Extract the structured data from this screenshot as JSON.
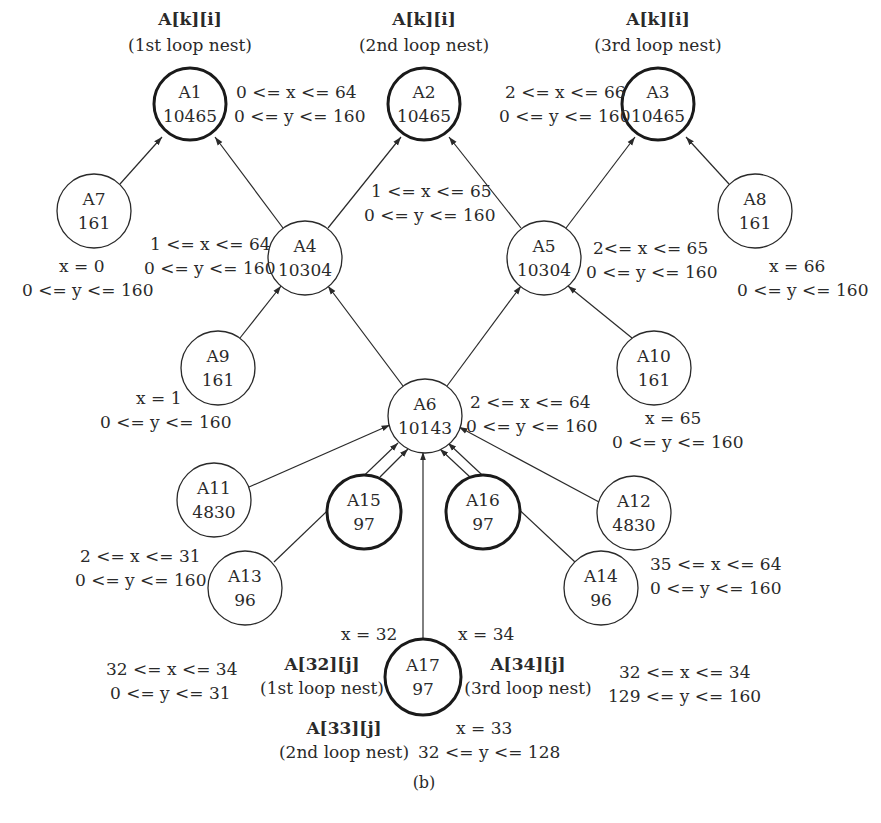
{
  "caption": "(b)",
  "nodes": {
    "A1": {
      "id": "A1",
      "value": "10465"
    },
    "A2": {
      "id": "A2",
      "value": "10465"
    },
    "A3": {
      "id": "A3",
      "value": "10465"
    },
    "A4": {
      "id": "A4",
      "value": "10304"
    },
    "A5": {
      "id": "A5",
      "value": "10304"
    },
    "A6": {
      "id": "A6",
      "value": "10143"
    },
    "A7": {
      "id": "A7",
      "value": "161"
    },
    "A8": {
      "id": "A8",
      "value": "161"
    },
    "A9": {
      "id": "A9",
      "value": "161"
    },
    "A10": {
      "id": "A10",
      "value": "161"
    },
    "A11": {
      "id": "A11",
      "value": "4830"
    },
    "A12": {
      "id": "A12",
      "value": "4830"
    },
    "A13": {
      "id": "A13",
      "value": "96"
    },
    "A14": {
      "id": "A14",
      "value": "96"
    },
    "A15": {
      "id": "A15",
      "value": "97"
    },
    "A16": {
      "id": "A16",
      "value": "97"
    },
    "A17": {
      "id": "A17",
      "value": "97"
    }
  },
  "access_labels": {
    "A1": {
      "ref": "A[k][i]",
      "nest": "(1st loop nest)"
    },
    "A2": {
      "ref": "A[k][i]",
      "nest": "(2nd loop nest)"
    },
    "A3": {
      "ref": "A[k][i]",
      "nest": "(3rd loop nest)"
    },
    "A15": {
      "ref": "A[32][j]",
      "nest": "(1st loop nest)"
    },
    "A17": {
      "ref": "A[33][j]",
      "nest": "(2nd loop nest)"
    },
    "A16": {
      "ref": "A[34][j]",
      "nest": "(3rd loop nest)"
    }
  },
  "ranges": {
    "A1": {
      "x": "0 <= x <= 64",
      "y": "0 <= y <= 160"
    },
    "A2": {
      "x": "1 <= x <= 65",
      "y": "0 <= y <= 160"
    },
    "A3": {
      "x": "2 <= x <= 66",
      "y": "0 <= y <= 160"
    },
    "A4": {
      "x": "1 <= x <= 64",
      "y": "0 <= y <= 160"
    },
    "A5": {
      "x": "2<= x <= 65",
      "y": "0 <= y <= 160"
    },
    "A6": {
      "x": "2 <= x <= 64",
      "y": "0 <= y <= 160"
    },
    "A7": {
      "x": "x = 0",
      "y": "0 <= y <= 160"
    },
    "A8": {
      "x": "x = 66",
      "y": "0 <= y <= 160"
    },
    "A9": {
      "x": "x = 1",
      "y": "0 <= y <= 160"
    },
    "A10": {
      "x": "x = 65",
      "y": "0 <= y <= 160"
    },
    "A11": {
      "x": "2 <= x <= 31",
      "y": "0 <= y <= 160"
    },
    "A12": {
      "x": "35 <= x <= 64",
      "y": "0 <= y <= 160"
    },
    "A13": {
      "x": "32 <= x <= 34",
      "y": "0 <= y <= 31"
    },
    "A14": {
      "x": "32 <= x <= 34",
      "y": "129 <= y <= 160"
    },
    "A15": {
      "x": "x = 32"
    },
    "A16": {
      "x": "x = 34"
    },
    "A17": {
      "x": "x = 33",
      "y": "32 <= y <= 128"
    }
  },
  "edges": [
    [
      "A7",
      "A1"
    ],
    [
      "A4",
      "A1"
    ],
    [
      "A4",
      "A2"
    ],
    [
      "A5",
      "A2"
    ],
    [
      "A5",
      "A3"
    ],
    [
      "A8",
      "A3"
    ],
    [
      "A9",
      "A4"
    ],
    [
      "A6",
      "A4"
    ],
    [
      "A6",
      "A5"
    ],
    [
      "A10",
      "A5"
    ],
    [
      "A11",
      "A6"
    ],
    [
      "A13",
      "A6"
    ],
    [
      "A15",
      "A6"
    ],
    [
      "A17",
      "A6"
    ],
    [
      "A16",
      "A6"
    ],
    [
      "A14",
      "A6"
    ],
    [
      "A12",
      "A6"
    ]
  ],
  "colors": {
    "stroke": "#2a2a2a",
    "background": "#ffffff"
  }
}
